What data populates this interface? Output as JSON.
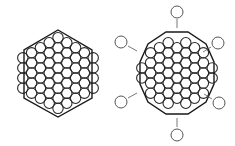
{
  "figure": {
    "description": "Two close-packed hexagonal atom clusters",
    "colors": {
      "background": "#ffffff",
      "stroke": "#2a2a2a",
      "outline": "#1a1a1a",
      "outer_circle": "#555555"
    },
    "left_cluster": {
      "label": "Hexagonal close-packed cluster with hexagon outline",
      "center": [
        58,
        73
      ],
      "radius": 5.2,
      "col_spacing": 8.8,
      "row_spacing": 10.1,
      "columns": [
        {
          "dx": -4,
          "n": 4
        },
        {
          "dx": -3,
          "n": 5
        },
        {
          "dx": -2,
          "n": 6
        },
        {
          "dx": -1,
          "n": 7
        },
        {
          "dx": 0,
          "n": 8
        },
        {
          "dx": 1,
          "n": 7
        },
        {
          "dx": 2,
          "n": 6
        },
        {
          "dx": 3,
          "n": 5
        },
        {
          "dx": 4,
          "n": 4
        }
      ],
      "hexagon_points": [
        [
          58,
          30
        ],
        [
          92,
          50
        ],
        [
          92,
          98
        ],
        [
          58,
          117
        ],
        [
          24,
          98
        ],
        [
          24,
          50
        ]
      ]
    },
    "right_cluster": {
      "label": "Cluster with vertex atoms detached and moving outward",
      "center": [
        177,
        73
      ],
      "radius": 5.2,
      "col_spacing": 8.8,
      "row_spacing": 10.1,
      "columns": [
        {
          "dx": -4,
          "n": 2
        },
        {
          "dx": -3,
          "n": 5
        },
        {
          "dx": -2,
          "n": 6
        },
        {
          "dx": -1,
          "n": 7
        },
        {
          "dx": 0,
          "n": 6
        },
        {
          "dx": 1,
          "n": 7
        },
        {
          "dx": 2,
          "n": 6
        },
        {
          "dx": 3,
          "n": 5
        },
        {
          "dx": 4,
          "n": 2
        }
      ],
      "outline_points": [
        [
          166,
          32
        ],
        [
          188,
          32
        ],
        [
          206,
          44
        ],
        [
          214,
          62
        ],
        [
          214,
          84
        ],
        [
          206,
          102
        ],
        [
          188,
          114
        ],
        [
          166,
          114
        ],
        [
          148,
          102
        ],
        [
          140,
          84
        ],
        [
          140,
          62
        ],
        [
          148,
          44
        ]
      ],
      "detached_atoms": [
        {
          "cx": 177,
          "cy": 12,
          "ax1": 177,
          "ay1": 19,
          "ax2": 177,
          "ay2": 28,
          "name": "top"
        },
        {
          "cx": 177,
          "cy": 135,
          "ax1": 177,
          "ay1": 127,
          "ax2": 177,
          "ay2": 118,
          "name": "bottom"
        },
        {
          "cx": 121,
          "cy": 42,
          "ax1": 128,
          "ay1": 46,
          "ax2": 137,
          "ay2": 51,
          "name": "upper-left"
        },
        {
          "cx": 218,
          "cy": 43,
          "ax1": 211,
          "ay1": 47,
          "ax2": 203,
          "ay2": 52,
          "name": "upper-right"
        },
        {
          "cx": 121,
          "cy": 102,
          "ax1": 128,
          "ay1": 98,
          "ax2": 137,
          "ay2": 93,
          "name": "lower-left"
        },
        {
          "cx": 219,
          "cy": 103,
          "ax1": 212,
          "ay1": 99,
          "ax2": 204,
          "ay2": 94,
          "name": "lower-right"
        }
      ]
    }
  }
}
